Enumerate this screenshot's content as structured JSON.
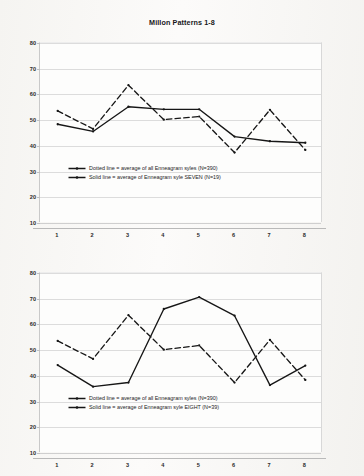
{
  "document": {
    "background_color": "#f7f6f4",
    "ink_color": "#161616"
  },
  "charts": [
    {
      "id": "chart-1",
      "title": "Millon Patterns 1-8",
      "legend": [
        {
          "marker": "dashed-line-marker",
          "label": "Dotted line = average of all Enneagram syles (N=390)"
        },
        {
          "marker": "solid-line-marker",
          "label": "Solid line = average of Enneagram syle SEVEN (N=19)"
        }
      ],
      "chart_data": {
        "type": "line",
        "title": "Millon Patterns 1-8",
        "xlabel": "",
        "ylabel": "",
        "categories": [
          "1",
          "2",
          "3",
          "4",
          "5",
          "6",
          "7",
          "8"
        ],
        "x": [
          1,
          2,
          3,
          4,
          5,
          6,
          7,
          8
        ],
        "ylim": [
          10,
          80
        ],
        "yticks": [
          10,
          20,
          30,
          40,
          50,
          60,
          70,
          80
        ],
        "grid": true,
        "legend_position": "inside-bottom-center",
        "series": [
          {
            "name": "Dotted line = average of all Enneagram syles (N=390)",
            "style": "dashed",
            "values": [
              53.6,
              46.6,
              63.6,
              50.2,
              51.4,
              37.4,
              54.0,
              38.4
            ]
          },
          {
            "name": "Solid line = average of Enneagram syle SEVEN (N=19)",
            "style": "solid",
            "values": [
              48.4,
              45.6,
              55.2,
              54.2,
              54.2,
              43.6,
              41.8,
              41.2
            ]
          }
        ]
      }
    },
    {
      "id": "chart-2",
      "title": "",
      "legend": [
        {
          "marker": "dashed-line-marker",
          "label": "Dotted line = average of all Enneagram syles (N=390)"
        },
        {
          "marker": "solid-line-marker",
          "label": "Solid line = average of Enneagram syle EIGHT (N=39)"
        }
      ],
      "chart_data": {
        "type": "line",
        "title": "",
        "xlabel": "",
        "ylabel": "",
        "categories": [
          "1",
          "2",
          "3",
          "4",
          "5",
          "6",
          "7",
          "8"
        ],
        "x": [
          1,
          2,
          3,
          4,
          5,
          6,
          7,
          8
        ],
        "ylim": [
          10,
          80
        ],
        "yticks": [
          10,
          20,
          30,
          40,
          50,
          60,
          70,
          80
        ],
        "grid": true,
        "legend_position": "inside-bottom-center",
        "series": [
          {
            "name": "Dotted line = average of all Enneagram syles (N=390)",
            "style": "dashed",
            "values": [
              53.6,
              46.6,
              63.6,
              50.2,
              51.8,
              37.4,
              54.0,
              38.4
            ]
          },
          {
            "name": "Solid line = average of Enneagram syle EIGHT (N=39)",
            "style": "solid",
            "values": [
              44.2,
              35.8,
              37.4,
              66.0,
              70.6,
              63.4,
              36.4,
              44.0
            ]
          }
        ]
      }
    }
  ]
}
